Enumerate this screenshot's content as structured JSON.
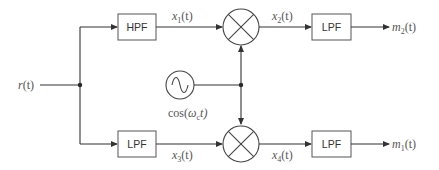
{
  "diagram": {
    "type": "block-diagram",
    "input": {
      "label": "r",
      "arg": "(t)"
    },
    "blocks": {
      "hpf_top": "HPF",
      "lpf_top_out": "LPF",
      "lpf_bottom_in": "LPF",
      "lpf_bottom_out": "LPF"
    },
    "oscillator": {
      "label_fn": "cos(",
      "label_omega": "ω",
      "label_sub": "c",
      "label_tail": "t)"
    },
    "signals": {
      "x1": {
        "name": "x",
        "sub": "1",
        "arg": "(t)"
      },
      "x2": {
        "name": "x",
        "sub": "2",
        "arg": "(t)"
      },
      "x3": {
        "name": "x",
        "sub": "3",
        "arg": "(t)"
      },
      "x4": {
        "name": "x",
        "sub": "4",
        "arg": "(t)"
      },
      "m2": {
        "name": "m",
        "sub": "2",
        "arg": "(t)"
      },
      "m1": {
        "name": "m",
        "sub": "1",
        "arg": "(t)"
      }
    },
    "colors": {
      "line": "#333333",
      "text": "#555555",
      "box_border": "#555555"
    }
  }
}
